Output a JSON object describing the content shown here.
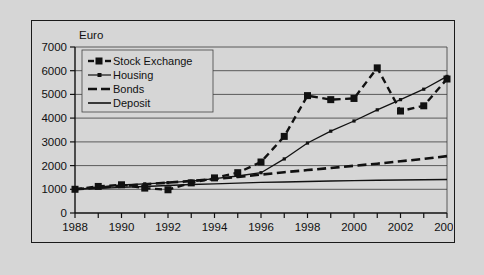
{
  "chart_data": {
    "type": "line",
    "title": "",
    "unit_label": "Euro",
    "xlabel": "",
    "ylabel": "Euro",
    "x": [
      1988,
      1989,
      1990,
      1991,
      1992,
      1993,
      1994,
      1995,
      1996,
      1997,
      1998,
      1999,
      2000,
      2001,
      2002,
      2003,
      2004
    ],
    "xtick_labels": [
      "1988",
      "1990",
      "1992",
      "1994",
      "1996",
      "1998",
      "2000",
      "2002",
      "2004"
    ],
    "xtick_values": [
      1988,
      1990,
      1992,
      1994,
      1996,
      1998,
      2000,
      2002,
      2004
    ],
    "xlim": [
      1987.5,
      2004.5
    ],
    "ytick_labels": [
      "0",
      "1000",
      "2000",
      "3000",
      "4000",
      "5000",
      "6000",
      "7000"
    ],
    "ytick_values": [
      0,
      1000,
      2000,
      3000,
      4000,
      5000,
      6000,
      7000
    ],
    "ylim": [
      0,
      7000
    ],
    "grid": "horizontal",
    "legend_position": "upper-left-inside",
    "series": [
      {
        "name": "Stock Exchange",
        "style": "dashed-with-square-markers",
        "color": "#111111",
        "values": [
          1000,
          1120,
          1190,
          1050,
          980,
          1270,
          1480,
          1700,
          2150,
          3230,
          4950,
          4780,
          4830,
          6120,
          4300,
          4520,
          5650
        ]
      },
      {
        "name": "Housing",
        "style": "solid-thin-with-small-markers",
        "color": "#111111",
        "values": [
          1000,
          1080,
          1180,
          1230,
          1280,
          1340,
          1450,
          1560,
          1700,
          2280,
          2950,
          3450,
          3880,
          4350,
          4780,
          5220,
          5760
        ]
      },
      {
        "name": "Bonds",
        "style": "dashed-thick",
        "color": "#111111",
        "values": [
          1000,
          1070,
          1140,
          1210,
          1280,
          1350,
          1430,
          1520,
          1620,
          1720,
          1810,
          1900,
          1990,
          2080,
          2180,
          2280,
          2400
        ]
      },
      {
        "name": "Deposit",
        "style": "solid-thin",
        "color": "#111111",
        "values": [
          1000,
          1040,
          1080,
          1120,
          1160,
          1200,
          1230,
          1260,
          1290,
          1310,
          1330,
          1350,
          1365,
          1380,
          1390,
          1400,
          1410
        ]
      }
    ]
  },
  "legend": {
    "items": [
      {
        "label": "Stock Exchange"
      },
      {
        "label": "Housing"
      },
      {
        "label": "Bonds"
      },
      {
        "label": "Deposit"
      }
    ]
  },
  "colors": {
    "page_background": "#d6d6d6",
    "frame_border": "#1a1a1a",
    "ink": "#111111",
    "gridline": "#3a3a3a"
  }
}
